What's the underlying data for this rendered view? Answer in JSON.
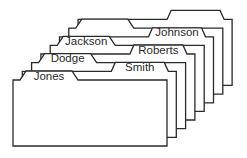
{
  "diagram": {
    "type": "index-card-file",
    "colors": {
      "stroke": "#2a2a2a",
      "fill": "#ffffff",
      "text": "#2a2a2a"
    },
    "cards": [
      {
        "label": "Jones",
        "tab_position": "left"
      },
      {
        "label": "Smith",
        "tab_position": "right"
      },
      {
        "label": "Dodge",
        "tab_position": "left"
      },
      {
        "label": "Roberts",
        "tab_position": "right"
      },
      {
        "label": "Jackson",
        "tab_position": "left"
      },
      {
        "label": "Johnson",
        "tab_position": "right"
      },
      {
        "label": "",
        "tab_position": "left"
      },
      {
        "label": "",
        "tab_position": "right"
      }
    ]
  }
}
